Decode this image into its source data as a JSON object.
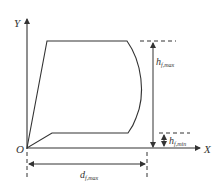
{
  "diagram": {
    "type": "geometric-profile",
    "colors": {
      "line": "#333333",
      "background": "#ffffff"
    },
    "axes": {
      "x_label": "X",
      "y_label": "Y",
      "origin_label": "O"
    },
    "dimensions": {
      "h_max": {
        "main": "h",
        "sub": "f,max"
      },
      "h_min": {
        "main": "h",
        "sub": "f,min"
      },
      "d_max": {
        "main": "d",
        "sub": "f,max"
      }
    }
  }
}
